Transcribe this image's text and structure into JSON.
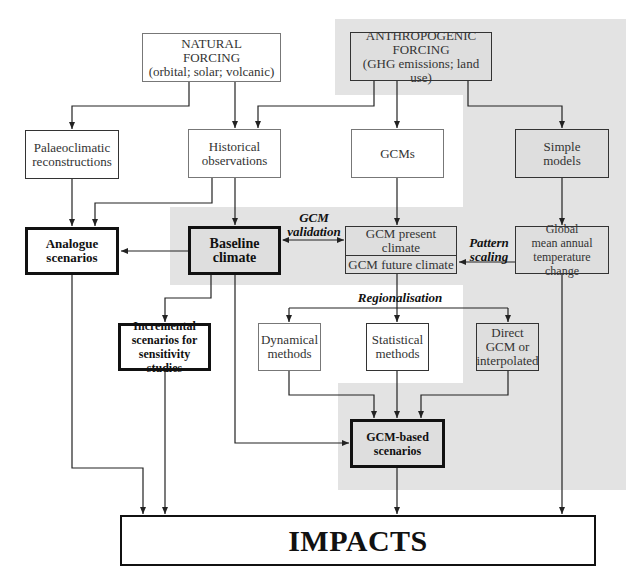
{
  "diagram": {
    "nodes": {
      "natural_forcing": "NATURAL\nFORCING\n(orbital; solar; volcanic)",
      "anthropogenic_forcing": "ANTHROPOGENIC\nFORCING\n(GHG emissions; land use)",
      "palaeoclimatic": "Palaeoclimatic\nreconstructions",
      "historical": "Historical\nobservations",
      "gcms": "GCMs",
      "simple_models": "Simple\nmodels",
      "analogue": "Analogue\nscenarios",
      "baseline": "Baseline\nclimate",
      "gcm_present": "GCM present climate",
      "gcm_future": "GCM future climate",
      "global_mean": "Global\nmean annual\ntemperature change",
      "incremental": "Incremental\nscenarios for\nsensitivity studies",
      "dynamical": "Dynamical\nmethods",
      "statistical": "Statistical\nmethods",
      "direct_gcm": "Direct\nGCM or\ninterpolated",
      "gcm_based": "GCM-based\nscenarios",
      "impacts": "IMPACTS"
    },
    "edge_labels": {
      "gcm_validation": "GCM\nvalidation",
      "pattern_scaling": "Pattern\nscaling",
      "regionalisation": "Regionalisation"
    },
    "colors": {
      "shading": "#e3e3e3",
      "line": "#222222",
      "background": "#ffffff"
    }
  }
}
